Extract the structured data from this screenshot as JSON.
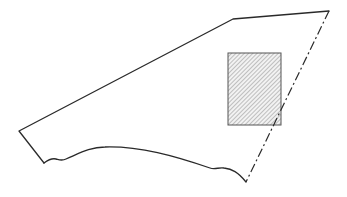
{
  "diagram": {
    "type": "line-drawing",
    "colors": {
      "stroke": "#2a2a2a",
      "hatch": "#8a8a8a",
      "rect_border": "#555555",
      "background": "#ffffff"
    },
    "shape": {
      "solid_edges": [
        {
          "name": "left-to-top",
          "from": [
            19,
            131
          ],
          "to": [
            233,
            19
          ]
        },
        {
          "name": "top-edge",
          "from": [
            233,
            19
          ],
          "to": [
            329,
            11
          ]
        },
        {
          "name": "left-short-edge",
          "from": [
            19,
            131
          ],
          "to": [
            44,
            163
          ]
        }
      ],
      "bottom_curve": [
        [
          44,
          163
        ],
        [
          55,
          158
        ],
        [
          63,
          160
        ],
        [
          100,
          147
        ],
        [
          150,
          150
        ],
        [
          210,
          168
        ],
        [
          222,
          167
        ],
        [
          238,
          172
        ],
        [
          246,
          182
        ]
      ],
      "dashed_edge": {
        "from": [
          329,
          11
        ],
        "to": [
          246,
          182
        ]
      }
    },
    "hatched_rect": {
      "x": 228,
      "y": 53,
      "width": 53,
      "height": 72
    }
  }
}
